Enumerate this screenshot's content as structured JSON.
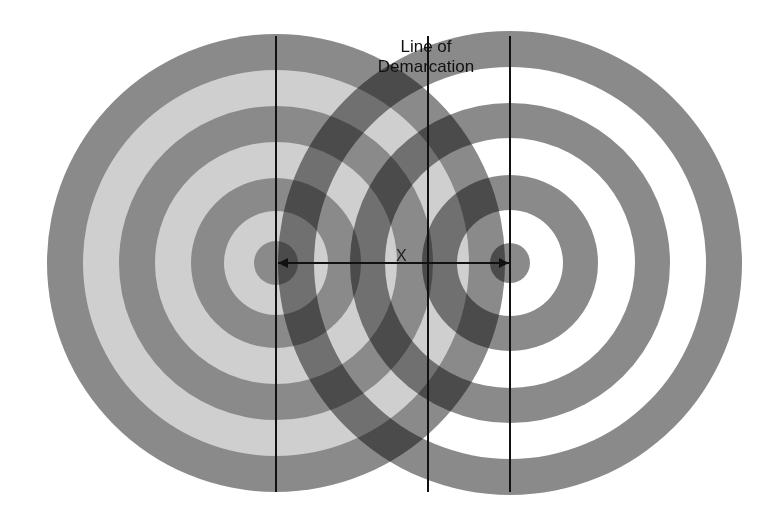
{
  "diagram": {
    "title_lines": [
      "Line of",
      "Demarcation"
    ],
    "distance_label": "X",
    "colors": {
      "dark_ring": "#8a8a8a",
      "light_ring": "#cfcfcf",
      "line": "#111111",
      "background": "#ffffff"
    },
    "left_target": {
      "center": [
        276,
        263
      ],
      "ring_radii": [
        229,
        193,
        157,
        121,
        85,
        52,
        22
      ],
      "ring_fills": [
        "#8a8a8a",
        "#cfcfcf",
        "#8a8a8a",
        "#cfcfcf",
        "#8a8a8a",
        "#cfcfcf",
        "#8a8a8a"
      ]
    },
    "right_target": {
      "center": [
        510,
        263
      ],
      "ring_radii": [
        232,
        196,
        160,
        125,
        88,
        53,
        20
      ],
      "ring_fills": [
        "#8a8a8a",
        "#ffffff",
        "#8a8a8a",
        "#ffffff",
        "#8a8a8a",
        "#ffffff",
        "#8a8a8a"
      ]
    },
    "vertical_lines": [
      {
        "name": "left-center-line",
        "x": 275,
        "y1": 36,
        "y2": 492
      },
      {
        "name": "line-of-demarcation",
        "x": 427,
        "y1": 36,
        "y2": 492
      },
      {
        "name": "right-center-line",
        "x": 509,
        "y1": 36,
        "y2": 492
      }
    ],
    "distance_arrow": {
      "x1": 278,
      "x2": 509,
      "y": 263
    }
  }
}
